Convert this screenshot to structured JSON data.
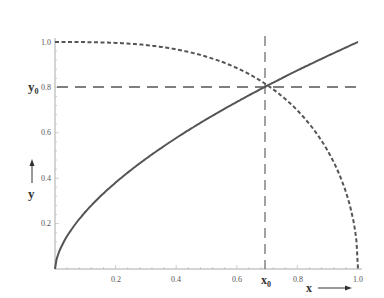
{
  "chart_data": {
    "type": "line",
    "title": "",
    "xlabel": "x",
    "ylabel": "y",
    "xlim": [
      0,
      1.0
    ],
    "ylim": [
      0,
      1.0
    ],
    "grid": false,
    "legend": null,
    "x_ticks": [
      "0.2",
      "0.4",
      "0.6",
      "0.8",
      "1.0"
    ],
    "y_ticks": [
      "0.2",
      "0.4",
      "0.6",
      "0.8",
      "1.0"
    ],
    "series": [
      {
        "name": "increasing curve",
        "style": "solid",
        "x": [
          0,
          0.1,
          0.2,
          0.3,
          0.4,
          0.5,
          0.6,
          0.69,
          0.8,
          0.9,
          1.0
        ],
        "y": [
          0,
          0.25,
          0.38,
          0.49,
          0.58,
          0.66,
          0.74,
          0.8,
          0.87,
          0.94,
          1.0
        ]
      },
      {
        "name": "decreasing curve",
        "style": "dashed",
        "x": [
          0,
          0.1,
          0.2,
          0.3,
          0.4,
          0.5,
          0.6,
          0.69,
          0.8,
          0.9,
          0.95,
          1.0
        ],
        "y": [
          1.0,
          1.0,
          1.0,
          0.99,
          0.97,
          0.94,
          0.89,
          0.8,
          0.7,
          0.52,
          0.38,
          0
        ]
      }
    ],
    "annotations": [
      {
        "label": "x0",
        "x": 0.69,
        "style": "long-dash vertical line"
      },
      {
        "label": "y0",
        "y": 0.8,
        "style": "long-dash horizontal line"
      },
      {
        "label": "x →",
        "position": "below x-axis right"
      },
      {
        "label": "↑ y",
        "position": "left of y-axis"
      }
    ]
  },
  "labels": {
    "x0_main": "x",
    "x0_sub": "0",
    "y0_main": "y",
    "y0_sub": "0",
    "x_axis": "x",
    "y_axis": "y",
    "xt": [
      "0.2",
      "0.4",
      "0.6",
      "0.8",
      "1.0"
    ],
    "yt": [
      "0.2",
      "0.4",
      "0.6",
      "0.8",
      "1.0"
    ]
  },
  "colors": {
    "curve": "#555555",
    "axis": "#999999",
    "guide": "#555555"
  }
}
